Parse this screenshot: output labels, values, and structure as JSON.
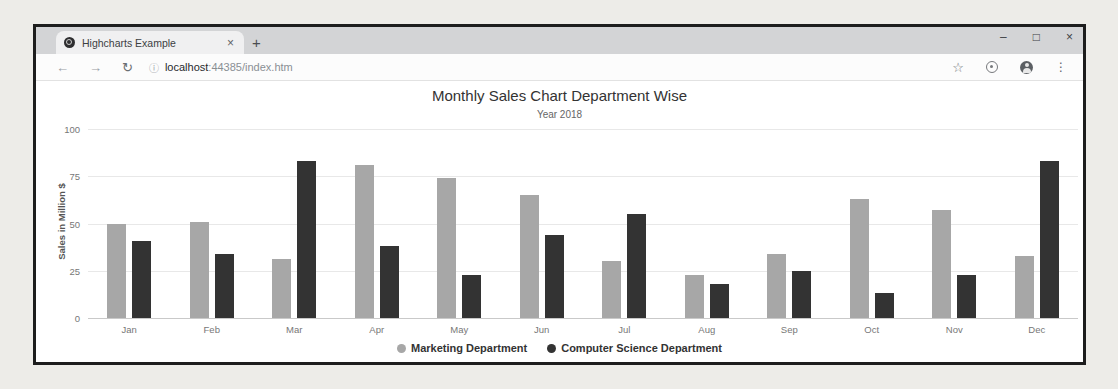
{
  "browser": {
    "tab": {
      "title": "Highcharts Example",
      "close": "×",
      "new_tab": "+"
    },
    "window_controls": {
      "minimize": "–",
      "maximize": "□",
      "close": "×"
    },
    "toolbar": {
      "back": "←",
      "forward": "→",
      "reload": "↻",
      "info": "ⓘ",
      "url_host": "localhost",
      "url_rest": ":44385/index.htm",
      "star": "☆",
      "menu": "⋮"
    }
  },
  "chart_data": {
    "type": "bar",
    "title": "Monthly Sales Chart Department Wise",
    "subtitle": "Year 2018",
    "ylabel": "Sales in Million $",
    "xlabel": "",
    "categories": [
      "Jan",
      "Feb",
      "Mar",
      "Apr",
      "May",
      "Jun",
      "Jul",
      "Aug",
      "Sep",
      "Oct",
      "Nov",
      "Dec"
    ],
    "series": [
      {
        "name": "Marketing Department",
        "color": "#a7a7a7",
        "values": [
          50,
          51,
          31,
          81,
          74,
          65,
          30,
          23,
          34,
          63,
          57,
          33
        ]
      },
      {
        "name": "Computer Science Department",
        "color": "#333333",
        "values": [
          41,
          34,
          83,
          38,
          23,
          44,
          55,
          18,
          25,
          13,
          23,
          83
        ]
      }
    ],
    "ylim": [
      0,
      100
    ],
    "yticks": [
      0,
      25,
      50,
      75,
      100
    ],
    "grid": true,
    "legend_position": "bottom"
  }
}
